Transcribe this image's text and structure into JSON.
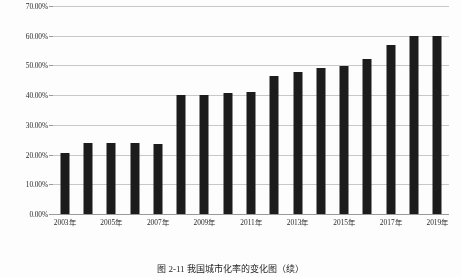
{
  "chart_data": {
    "type": "bar",
    "title": "",
    "xlabel": "",
    "ylabel": "",
    "ylim": [
      0,
      70
    ],
    "grid": true,
    "legend": "none",
    "bar_color": "#1c1c1c",
    "gridline_color": "#c8c8c8",
    "axis_color": "#9a9a9a",
    "background_color": "#ffffff",
    "y_tick_labels": [
      "70.00%",
      "60.00%",
      "50.00%",
      "40.00%",
      "30.00%",
      "20.00%",
      "10.00%",
      "0.00%"
    ],
    "y_tick_values": [
      70,
      60,
      50,
      40,
      30,
      20,
      10,
      0
    ],
    "categories": [
      "2003年",
      "2004年",
      "2005年",
      "2006年",
      "2007年",
      "2008年",
      "2009年",
      "2010年",
      "2011年",
      "2012年",
      "2013年",
      "2014年",
      "2015年",
      "2016年",
      "2017年",
      "2018年",
      "2019年"
    ],
    "x_tick_labels": [
      "2003年",
      "2005年",
      "2007年",
      "2009年",
      "2011年",
      "2013年",
      "2015年",
      "2017年",
      "2019年"
    ],
    "values": [
      20.5,
      23.8,
      23.8,
      23.8,
      23.6,
      40.0,
      40.0,
      40.7,
      41.0,
      46.6,
      47.8,
      49.2,
      49.7,
      52.2,
      56.8,
      60.0,
      60.0
    ],
    "values_display": [
      "20.50%",
      "23.80%",
      "23.80%",
      "23.80%",
      "23.60%",
      "40.00%",
      "40.00%",
      "40.70%",
      "41.00%",
      "46.60%",
      "47.80%",
      "49.20%",
      "49.70%",
      "52.20%",
      "56.80%",
      "60.00%",
      "60.00%"
    ]
  },
  "figure": {
    "caption": "图 2-11  我国城市化率的变化图（续）"
  }
}
